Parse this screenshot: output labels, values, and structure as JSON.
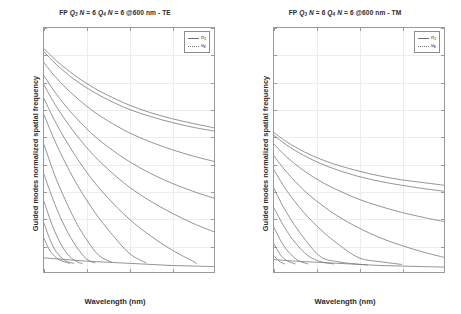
{
  "figure": {
    "background": "#ffffff",
    "line_color": "#808080",
    "grid_color": "#ededed",
    "axis_color": "#9a9a9a"
  },
  "panels": [
    {
      "id": "te",
      "title_prefix": "FP",
      "title_q3": "Q",
      "title_q3_sub": "3",
      "title_n1": "N",
      "title_n1_val": "= 6",
      "title_q4": "Q",
      "title_q4_sub": "4",
      "title_n2": "N",
      "title_n2_val": "= 6",
      "title_suffix": "@600 nm - TE",
      "title_full": "FP Q3 N = 6 Q4 N = 6 @600 nm - TE",
      "polarization": "TE",
      "xlabel": "Wavelength (nm)",
      "ylabel": "Guided modes normalized spatial frequency",
      "legend": [
        {
          "label": "n",
          "sub": "1",
          "style": "solid"
        },
        {
          "label": "ν",
          "sub": "E",
          "style": "dotted"
        }
      ]
    },
    {
      "id": "tm",
      "title_prefix": "FP",
      "title_q3": "Q",
      "title_q3_sub": "3",
      "title_n1": "N",
      "title_n1_val": "= 6",
      "title_q4": "Q",
      "title_q4_sub": "4",
      "title_n2": "N",
      "title_n2_val": "= 6",
      "title_suffix": "@600 nm - TM",
      "title_full": "FP Q3 N = 6 Q4 N = 6 @600 nm - TM",
      "polarization": "TM",
      "xlabel": "Wavelength (nm)",
      "ylabel": "Guided modes normalized spatial frequency",
      "legend": [
        {
          "label": "n",
          "sub": "1",
          "style": "solid"
        },
        {
          "label": "ν",
          "sub": "E",
          "style": "dotted"
        }
      ]
    }
  ],
  "chart_data": [
    {
      "type": "line",
      "panel": "TE",
      "title": "FP Q3 N = 6 Q4 N = 6 @600 nm - TE",
      "xlabel": "Wavelength (nm)",
      "ylabel": "Guided modes normalized spatial frequency",
      "xlim": [
        400,
        800
      ],
      "ylim": [
        1.5,
        1.95
      ],
      "xticks": [
        400,
        500,
        600,
        700,
        800
      ],
      "yticks": [
        1.5,
        1.55,
        1.6,
        1.65,
        1.7,
        1.75,
        1.8,
        1.85,
        1.9,
        1.95
      ],
      "grid": true,
      "legend_position": "top-right",
      "legend_entries": [
        "n1",
        "vE"
      ],
      "series": [
        {
          "name": "mode-0",
          "x": [
            400,
            430,
            470,
            510,
            550,
            600,
            650,
            700,
            750,
            800
          ],
          "values": [
            1.912,
            1.889,
            1.864,
            1.843,
            1.826,
            1.808,
            1.794,
            1.783,
            1.774,
            1.766
          ]
        },
        {
          "name": "mode-1",
          "x": [
            400,
            430,
            470,
            510,
            550,
            600,
            650,
            700,
            750,
            800
          ],
          "values": [
            1.906,
            1.882,
            1.856,
            1.835,
            1.818,
            1.8,
            1.787,
            1.776,
            1.767,
            1.76
          ]
        },
        {
          "name": "mode-2",
          "x": [
            400,
            430,
            470,
            510,
            550,
            600,
            650,
            700,
            750,
            800
          ],
          "values": [
            1.886,
            1.857,
            1.826,
            1.8,
            1.779,
            1.757,
            1.74,
            1.726,
            1.714,
            1.704
          ]
        },
        {
          "name": "mode-3",
          "x": [
            400,
            430,
            470,
            510,
            550,
            600,
            650,
            700,
            750,
            800
          ],
          "values": [
            1.862,
            1.827,
            1.789,
            1.757,
            1.731,
            1.704,
            1.682,
            1.664,
            1.649,
            1.636
          ]
        },
        {
          "name": "mode-4",
          "x": [
            400,
            430,
            470,
            510,
            550,
            600,
            650,
            700,
            750,
            800
          ],
          "values": [
            1.845,
            1.804,
            1.759,
            1.721,
            1.69,
            1.657,
            1.631,
            1.609,
            1.59,
            1.574
          ]
        },
        {
          "name": "mode-5",
          "x": [
            400,
            430,
            470,
            510,
            550,
            600,
            650,
            700,
            750,
            760
          ],
          "values": [
            1.82,
            1.772,
            1.719,
            1.674,
            1.637,
            1.598,
            1.567,
            1.541,
            1.52,
            1.515
          ]
        },
        {
          "name": "mode-6",
          "x": [
            400,
            430,
            470,
            510,
            550,
            600,
            640
          ],
          "values": [
            1.79,
            1.734,
            1.672,
            1.621,
            1.579,
            1.535,
            1.517
          ]
        },
        {
          "name": "mode-7",
          "x": [
            400,
            430,
            470,
            500,
            530,
            560
          ],
          "values": [
            1.735,
            1.669,
            1.6,
            1.56,
            1.53,
            1.518
          ]
        },
        {
          "name": "mode-8",
          "x": [
            400,
            425,
            450,
            475,
            500,
            520
          ],
          "values": [
            1.68,
            1.626,
            1.582,
            1.548,
            1.524,
            1.517
          ]
        },
        {
          "name": "mode-9",
          "x": [
            400,
            420,
            440,
            460,
            480,
            490
          ],
          "values": [
            1.63,
            1.585,
            1.551,
            1.529,
            1.518,
            1.516
          ]
        },
        {
          "name": "mode-10",
          "x": [
            400,
            415,
            430,
            450,
            470
          ],
          "values": [
            1.59,
            1.558,
            1.536,
            1.521,
            1.516
          ]
        },
        {
          "name": "mode-11",
          "x": [
            400,
            415,
            435,
            460
          ],
          "values": [
            1.562,
            1.538,
            1.523,
            1.516
          ]
        },
        {
          "name": "envelope-vE",
          "x": [
            400,
            450,
            500,
            550,
            600,
            650,
            700,
            750,
            800
          ],
          "values": [
            1.526,
            1.523,
            1.52,
            1.518,
            1.516,
            1.514,
            1.512,
            1.511,
            1.51
          ]
        }
      ]
    },
    {
      "type": "line",
      "panel": "TM",
      "title": "FP Q3 N = 6 Q4 N = 6 @600 nm - TM",
      "xlabel": "Wavelength (nm)",
      "ylabel": "Guided modes normalized spatial frequency",
      "xlim": [
        400,
        800
      ],
      "ylim": [
        1.5,
        1.95
      ],
      "xticks": [
        400,
        500,
        600,
        700,
        800
      ],
      "yticks": [
        1.5,
        1.55,
        1.6,
        1.65,
        1.7,
        1.75,
        1.8,
        1.85,
        1.9,
        1.95
      ],
      "grid": true,
      "legend_position": "top-right",
      "legend_entries": [
        "n1",
        "vE"
      ],
      "series": [
        {
          "name": "mode-0",
          "x": [
            400,
            430,
            470,
            510,
            550,
            600,
            650,
            700,
            750,
            800
          ],
          "values": [
            1.757,
            1.74,
            1.722,
            1.708,
            1.697,
            1.686,
            1.677,
            1.67,
            1.665,
            1.66
          ]
        },
        {
          "name": "mode-1",
          "x": [
            400,
            430,
            470,
            510,
            550,
            600,
            650,
            700,
            750,
            800
          ],
          "values": [
            1.752,
            1.734,
            1.715,
            1.7,
            1.688,
            1.676,
            1.667,
            1.66,
            1.654,
            1.649
          ]
        },
        {
          "name": "mode-2",
          "x": [
            400,
            430,
            470,
            510,
            550,
            600,
            650,
            700,
            750,
            800
          ],
          "values": [
            1.736,
            1.712,
            1.687,
            1.667,
            1.651,
            1.634,
            1.621,
            1.61,
            1.601,
            1.593
          ]
        },
        {
          "name": "mode-3",
          "x": [
            400,
            430,
            470,
            510,
            550,
            600,
            650,
            700,
            750,
            800
          ],
          "values": [
            1.714,
            1.684,
            1.651,
            1.625,
            1.603,
            1.581,
            1.563,
            1.549,
            1.537,
            1.527
          ]
        },
        {
          "name": "mode-4",
          "x": [
            400,
            430,
            470,
            510,
            550,
            600,
            650,
            700
          ],
          "values": [
            1.688,
            1.65,
            1.61,
            1.578,
            1.552,
            1.526,
            1.519,
            1.514
          ]
        },
        {
          "name": "mode-5",
          "x": [
            400,
            430,
            470,
            510,
            550,
            590,
            620
          ],
          "values": [
            1.654,
            1.609,
            1.563,
            1.528,
            1.519,
            1.515,
            1.513
          ]
        },
        {
          "name": "mode-6",
          "x": [
            400,
            425,
            450,
            480,
            510,
            540
          ],
          "values": [
            1.618,
            1.582,
            1.554,
            1.53,
            1.519,
            1.515
          ]
        },
        {
          "name": "mode-7",
          "x": [
            400,
            420,
            440,
            460,
            480
          ],
          "values": [
            1.582,
            1.552,
            1.532,
            1.52,
            1.515
          ]
        },
        {
          "name": "mode-8",
          "x": [
            400,
            415,
            430,
            450
          ],
          "values": [
            1.552,
            1.532,
            1.521,
            1.515
          ]
        },
        {
          "name": "mode-9",
          "x": [
            400,
            412,
            425
          ],
          "values": [
            1.53,
            1.52,
            1.515
          ]
        },
        {
          "name": "envelope-vE",
          "x": [
            400,
            450,
            500,
            550,
            600,
            650,
            700,
            750,
            800
          ],
          "values": [
            1.523,
            1.52,
            1.518,
            1.516,
            1.514,
            1.512,
            1.511,
            1.51,
            1.509
          ]
        }
      ]
    }
  ]
}
